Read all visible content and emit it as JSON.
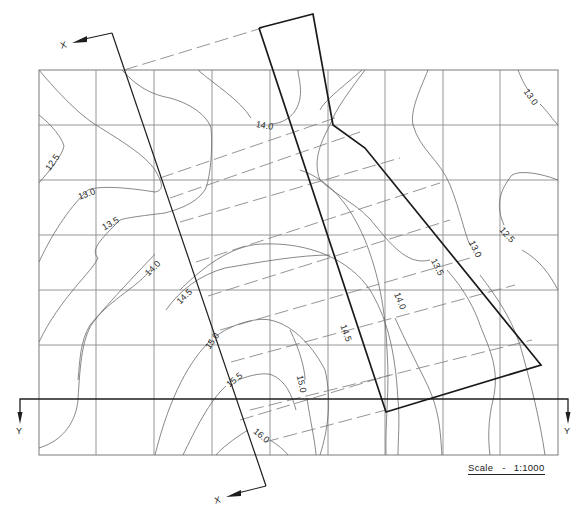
{
  "drawing": {
    "type": "contour_plan",
    "title": "Site plan with ground contours and plot outline",
    "grid": {
      "columns_x": [
        39,
        96,
        154,
        212,
        270,
        328,
        385,
        443,
        500,
        558
      ],
      "rows_y": [
        70,
        125,
        180,
        235,
        290,
        345,
        400,
        455
      ]
    },
    "contour_labels": [
      {
        "text": "12.5",
        "x": 44,
        "y": 168,
        "rot": -55
      },
      {
        "text": "13.0",
        "x": 78,
        "y": 196,
        "rot": -20
      },
      {
        "text": "13.5",
        "x": 102,
        "y": 226,
        "rot": -30
      },
      {
        "text": "14.0",
        "x": 146,
        "y": 270,
        "rot": -45
      },
      {
        "text": "14.5",
        "x": 175,
        "y": 302,
        "rot": -45
      },
      {
        "text": "15.0",
        "x": 200,
        "y": 344,
        "rot": -50
      },
      {
        "text": "15.5",
        "x": 224,
        "y": 382,
        "rot": -40
      },
      {
        "text": "16.0",
        "x": 255,
        "y": 437,
        "rot": 40
      },
      {
        "text": "15.0",
        "x": 301,
        "y": 383,
        "rot": 80
      },
      {
        "text": "14.5",
        "x": 346,
        "y": 333,
        "rot": 70
      },
      {
        "text": "14.0",
        "x": 398,
        "y": 300,
        "rot": 65
      },
      {
        "text": "14.0",
        "x": 256,
        "y": 127,
        "rot": 8
      },
      {
        "text": "13.5",
        "x": 436,
        "y": 266,
        "rot": 65
      },
      {
        "text": "13.0",
        "x": 474,
        "y": 249,
        "rot": 65
      },
      {
        "text": "12.5",
        "x": 504,
        "y": 236,
        "rot": 45
      },
      {
        "text": "13.0",
        "x": 528,
        "y": 96,
        "rot": 55
      }
    ],
    "axes": {
      "x_label_top": "X",
      "x_label_bottom": "X",
      "y_label_left": "Y",
      "y_label_right": "Y"
    },
    "scale": {
      "label": "Scale",
      "separator": "-",
      "value": "1:1000"
    }
  }
}
